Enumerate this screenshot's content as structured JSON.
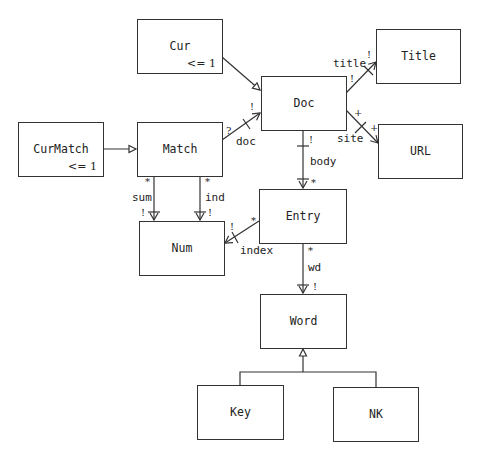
{
  "diagram": {
    "type": "object-model",
    "nodes": {
      "cur": {
        "label": "Cur",
        "multiplicity": "<= 1"
      },
      "curmatch": {
        "label": "CurMatch",
        "multiplicity": "<= 1"
      },
      "match": {
        "label": "Match"
      },
      "doc": {
        "label": "Doc"
      },
      "title": {
        "label": "Title"
      },
      "url": {
        "label": "URL"
      },
      "num": {
        "label": "Num"
      },
      "entry": {
        "label": "Entry"
      },
      "word": {
        "label": "Word"
      },
      "key": {
        "label": "Key"
      },
      "nk": {
        "label": "NK"
      }
    },
    "edges": {
      "cur_doc": {
        "from": "Cur",
        "to": "Doc",
        "kind": "subset"
      },
      "curmatch_match": {
        "from": "CurMatch",
        "to": "Match",
        "kind": "subset"
      },
      "doc": {
        "from": "Match",
        "to": "Doc",
        "label": "doc",
        "src_mult": "?",
        "dst_mult": "!"
      },
      "title": {
        "from": "Doc",
        "to": "Title",
        "label": "title",
        "src_mult": "!",
        "dst_mult": "!"
      },
      "site": {
        "from": "Doc",
        "to": "URL",
        "label": "site",
        "src_mult": "+",
        "dst_mult": "+"
      },
      "body": {
        "from": "Doc",
        "to": "Entry",
        "label": "body",
        "src_mult": "!",
        "dst_mult": "*"
      },
      "sum": {
        "from": "Match",
        "to": "Num",
        "label": "sum",
        "src_mult": "*",
        "dst_mult": "!"
      },
      "ind": {
        "from": "Match",
        "to": "Num",
        "label": "ind",
        "src_mult": "*",
        "dst_mult": "!"
      },
      "index": {
        "from": "Entry",
        "to": "Num",
        "label": "index",
        "src_mult": "*",
        "dst_mult": "!"
      },
      "wd": {
        "from": "Entry",
        "to": "Word",
        "label": "wd",
        "src_mult": "*",
        "dst_mult": "!"
      },
      "word_gen": {
        "from": [
          "Key",
          "NK"
        ],
        "to": "Word",
        "kind": "subset"
      }
    }
  }
}
